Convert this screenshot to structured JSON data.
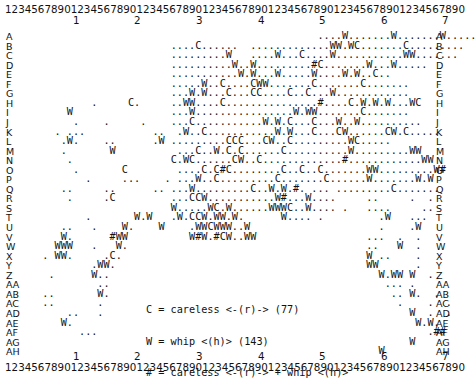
{
  "ruler": {
    "digits": "1234567890123456789012345678901234567890123456789012345678901234567890",
    "tens": [
      "1",
      "2",
      "3",
      "4",
      "5",
      "6",
      "7"
    ]
  },
  "rows": [
    {
      "label": "A",
      "cells": "                                                ....W.......W.......W....."
    },
    {
      "label": "B",
      "cells": "                        ....C......  .............WW.WC.......C........."
    },
    {
      "label": "C",
      "cells": "                        .........W   ....W...C....W...........WW......."
    },
    {
      "label": "D",
      "cells": "                        ..........W..W.........#C.......W...W....."
    },
    {
      "label": "E",
      "cells": "                        ...........W.W...W.....W....W.W..C.."
    },
    {
      "label": "F",
      "cells": "                        .....W..C....CWW.......C.......C......."
    },
    {
      "label": "G",
      "cells": "                        ...W.W...C...CC....C..C...W............"
    },
    {
      "label": "H",
      "cells": "           .     C.     ..WW....C...............#....C.W.W.W...WC"
    },
    {
      "label": "I",
      "cells": "       W                ...W................W.WW.......C......."
    },
    {
      "label": "J",
      "cells": "        .    .     .    ...C...........W.W.C...C...W..W.........."
    },
    {
      "label": "K",
      "cells": "     . ...           ..  .W..C...........W.W...C...CW......CW.C....."
    },
    {
      "label": "L",
      "cells": "      .W.    ..      .W .........CCC...CW..C.........WC....."
    },
    {
      "label": "M",
      "cells": "      .       W          ...C..W.C.C......C..........W.........WW"
    },
    {
      "label": "N",
      "cells": "       .                C.WC......CW..C.............#............WW"
    },
    {
      "label": "O",
      "cells": "        .       C        ....C.C#C........C..C..C.......WW.........W#"
    },
    {
      "label": "P",
      "cells": "          .     ...    . ...W..C.........C.......C......W.......W.W"
    },
    {
      "label": "Q",
      "cells": "      ..     ..      .. ...W.........C..W.W.#. ... .........C......."
    },
    {
      "label": "R",
      "cells": "       .     .C         ...CCW...........W#...W....     ..     .  ."
    },
    {
      "label": "S",
      "cells": "                        W.....WC.W......WWWC..W.... .   ....     .."
    },
    {
      "label": "T",
      "cells": "          .       W.W   .W.CCW.WW.W.      W.... .         .W   ..."
    },
    {
      "label": "U",
      "cells": "      ..   .    W.    W    .WWCWWW..W                     .    .W"
    },
    {
      "label": "V",
      "cells": "      W.      #WW          W#W.#CW..WW                  ...  .  ."
    },
    {
      "label": "W",
      "cells": "     WWW   .   W.                                       ..   W  ."
    },
    {
      "label": "X",
      "cells": "   . WW.     .C.                                        W ..    ."
    },
    {
      "label": "Y",
      "cells": "           .WW.                                         WW      ."
    },
    {
      "label": "Z",
      "cells": "    .      W..                                            W.WW W  ."
    },
    {
      "label": "AA",
      "cells": "            ..                                             ... ."
    },
    {
      "label": "AB",
      "cells": "   ..       W.                                              .. W.  ."
    },
    {
      "label": "AC",
      "cells": "   ..       .                                                .    .  ."
    },
    {
      "label": "AD",
      "cells": "       ..   .                                                  W  .  ."
    },
    {
      "label": "AE",
      "cells": "      W.                                                        W.W."
    },
    {
      "label": "AF",
      "cells": "         ...                                                      .##"
    },
    {
      "label": "AG",
      "cells": "                                                               W"
    },
    {
      "label": "AH",
      "cells": "                                                          W"
    }
  ],
  "legend": {
    "lines": [
      "C = careless <-(r)-> (77)",
      "W = whip <(h)> (143)",
      "# = careless <-(r)-> + whip <(h)>"
    ]
  }
}
